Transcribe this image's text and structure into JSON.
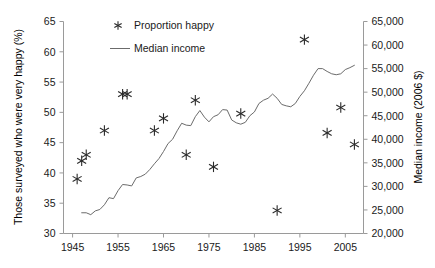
{
  "chart_data": {
    "type": "scatter",
    "title": "",
    "xlabel": "",
    "ylabel": "Those surveyed who were very happy (%)",
    "y2label": "Median income (2006 $)",
    "xlim": [
      1943,
      2009
    ],
    "ylim": [
      30,
      65
    ],
    "y2lim": [
      20000,
      65000
    ],
    "grid": false,
    "legend_position": "top-center",
    "xticks": [
      1945,
      1955,
      1965,
      1975,
      1985,
      1995,
      2005
    ],
    "xtick_labels": [
      "1945",
      "1955",
      "1965",
      "1975",
      "1985",
      "1995",
      "2005"
    ],
    "yticks": [
      30,
      35,
      40,
      45,
      50,
      55,
      60,
      65
    ],
    "ytick_labels": [
      "30",
      "35",
      "40",
      "45",
      "50",
      "55",
      "60",
      "65"
    ],
    "y2ticks": [
      20000,
      25000,
      30000,
      35000,
      40000,
      45000,
      50000,
      55000,
      60000,
      65000
    ],
    "y2tick_labels": [
      "20,000",
      "25,000",
      "30,000",
      "35,000",
      "40,000",
      "45,000",
      "50,000",
      "55,000",
      "60,000",
      "65,000"
    ],
    "series": [
      {
        "name": "Proportion happy",
        "type": "scatter",
        "marker": "asterisk",
        "axis": "left",
        "color": "#2a2a2a",
        "points": [
          {
            "x": 1946,
            "y": 39.0
          },
          {
            "x": 1947,
            "y": 42.0
          },
          {
            "x": 1948,
            "y": 43.0
          },
          {
            "x": 1952,
            "y": 47.0
          },
          {
            "x": 1956,
            "y": 53.0
          },
          {
            "x": 1957,
            "y": 53.0
          },
          {
            "x": 1963,
            "y": 47.0
          },
          {
            "x": 1965,
            "y": 49.0
          },
          {
            "x": 1970,
            "y": 43.0
          },
          {
            "x": 1972,
            "y": 52.0
          },
          {
            "x": 1976,
            "y": 41.0
          },
          {
            "x": 1982,
            "y": 49.8
          },
          {
            "x": 1990,
            "y": 33.8
          },
          {
            "x": 1996,
            "y": 62.0
          },
          {
            "x": 2001,
            "y": 46.6
          },
          {
            "x": 2004,
            "y": 50.8
          },
          {
            "x": 2007,
            "y": 44.7
          }
        ]
      },
      {
        "name": "Median income",
        "type": "line",
        "axis": "right",
        "color": "#6b6b6b",
        "x": [
          1947,
          1948,
          1949,
          1950,
          1951,
          1952,
          1953,
          1954,
          1955,
          1956,
          1957,
          1958,
          1959,
          1960,
          1961,
          1962,
          1963,
          1964,
          1965,
          1966,
          1967,
          1968,
          1969,
          1970,
          1971,
          1972,
          1973,
          1974,
          1975,
          1976,
          1977,
          1978,
          1979,
          1980,
          1981,
          1982,
          1983,
          1984,
          1985,
          1986,
          1987,
          1988,
          1989,
          1990,
          1991,
          1992,
          1993,
          1994,
          1995,
          1996,
          1997,
          1998,
          1999,
          2000,
          2001,
          2002,
          2003,
          2004,
          2005,
          2006,
          2007
        ],
        "values": [
          24400,
          24400,
          24000,
          24800,
          25100,
          26100,
          27600,
          27400,
          29100,
          30400,
          30300,
          30100,
          31800,
          32100,
          32600,
          33600,
          34800,
          35900,
          37400,
          39100,
          40000,
          41800,
          43400,
          43000,
          42900,
          44800,
          46100,
          44700,
          43700,
          44800,
          45200,
          46300,
          46200,
          44100,
          43500,
          43200,
          43600,
          45000,
          45800,
          47600,
          48300,
          48700,
          49600,
          48700,
          47400,
          47100,
          46900,
          47600,
          49100,
          50300,
          51900,
          53600,
          55000,
          55000,
          54400,
          53900,
          53700,
          53900,
          54800,
          55200,
          55700
        ]
      }
    ]
  },
  "legend": {
    "items": [
      {
        "label": "Proportion happy",
        "marker": "asterisk-marker"
      },
      {
        "label": "Median income",
        "marker": "line-marker"
      }
    ]
  },
  "axes": {
    "left_title": "Those surveyed who were very happy (%)",
    "right_title": "Median income (2006 $)"
  }
}
